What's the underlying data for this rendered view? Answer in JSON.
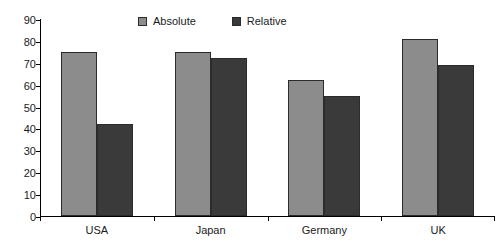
{
  "chart_data": {
    "type": "bar",
    "title": "",
    "xlabel": "",
    "ylabel": "",
    "ylim": [
      0,
      90
    ],
    "ytick_step": 10,
    "yticks": [
      0,
      10,
      20,
      30,
      40,
      50,
      60,
      70,
      80,
      90
    ],
    "grid": false,
    "legend_position": "top-center",
    "categories": [
      "USA",
      "Japan",
      "Germany",
      "UK"
    ],
    "series": [
      {
        "name": "Absolute",
        "color": "#8c8c8c",
        "values": [
          75,
          75,
          62,
          81
        ]
      },
      {
        "name": "Relative",
        "color": "#3a3a3a",
        "values": [
          42,
          72,
          55,
          69
        ]
      }
    ]
  },
  "legend": {
    "entries": [
      {
        "label": "Absolute"
      },
      {
        "label": "Relative"
      }
    ]
  },
  "colors": {
    "absolute": "#8c8c8c",
    "relative": "#3a3a3a",
    "axis": "#000000",
    "text": "#1a1a1a",
    "background": "#ffffff",
    "bar_border": "#2b2b2b"
  }
}
